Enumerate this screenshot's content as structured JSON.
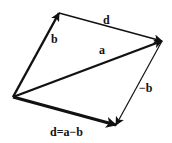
{
  "diagram": {
    "type": "vector-parallelogram",
    "background": "#ffffff",
    "ink": "#111111",
    "points": {
      "origin": [
        13,
        97
      ],
      "top": [
        59,
        13
      ],
      "right": [
        162,
        41
      ],
      "bottom": [
        116,
        125
      ]
    },
    "vectors": [
      {
        "id": "b",
        "label": "b",
        "from": "origin",
        "to": "top",
        "weight": "thick"
      },
      {
        "id": "d_top",
        "label": "d",
        "from": "top",
        "to": "right",
        "weight": "thin"
      },
      {
        "id": "a",
        "label": "a",
        "from": "origin",
        "to": "right",
        "weight": "thick"
      },
      {
        "id": "neg_b",
        "label": "−b",
        "from": "right",
        "to": "bottom",
        "weight": "thin"
      },
      {
        "id": "d",
        "label": "d=a−b",
        "from": "origin",
        "to": "bottom",
        "weight": "thickest"
      }
    ],
    "labels": {
      "b": "b",
      "d": "d",
      "a": "a",
      "neg_b": "−b",
      "d_eq": "d=a−b"
    }
  }
}
